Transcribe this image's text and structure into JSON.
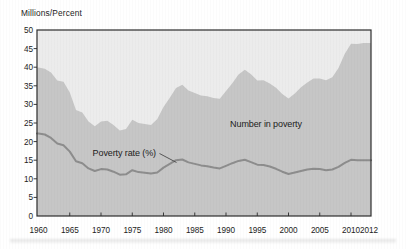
{
  "chart_data": {
    "type": "area",
    "ylabel": "Millions/Percent",
    "xlabel": "",
    "ylim": [
      0,
      50
    ],
    "ytick_step": 5,
    "yticks": [
      0,
      5,
      10,
      15,
      20,
      25,
      30,
      35,
      40,
      45,
      50
    ],
    "xticks": [
      1960,
      1965,
      1970,
      1975,
      1980,
      1985,
      1990,
      1995,
      2000,
      2005,
      2010,
      2012
    ],
    "grid": false,
    "legend": "in-plot annotations",
    "years": [
      1960,
      1961,
      1962,
      1963,
      1964,
      1965,
      1966,
      1967,
      1968,
      1969,
      1970,
      1971,
      1972,
      1973,
      1974,
      1975,
      1976,
      1977,
      1978,
      1979,
      1980,
      1981,
      1982,
      1983,
      1984,
      1985,
      1986,
      1987,
      1988,
      1989,
      1990,
      1991,
      1992,
      1993,
      1994,
      1995,
      1996,
      1997,
      1998,
      1999,
      2000,
      2001,
      2002,
      2003,
      2004,
      2005,
      2006,
      2007,
      2008,
      2009,
      2010,
      2011,
      2012
    ],
    "series": [
      {
        "name": "Number in poverty",
        "type": "area",
        "unit": "millions",
        "values": [
          39.9,
          39.6,
          38.6,
          36.4,
          36.1,
          33.2,
          28.5,
          27.8,
          25.4,
          24.1,
          25.4,
          25.6,
          24.5,
          23.0,
          23.4,
          25.9,
          25.0,
          24.7,
          24.5,
          26.1,
          29.3,
          31.8,
          34.4,
          35.3,
          33.7,
          33.1,
          32.4,
          32.2,
          31.7,
          31.5,
          33.6,
          35.7,
          38.0,
          39.3,
          38.1,
          36.4,
          36.5,
          35.6,
          34.5,
          32.8,
          31.6,
          32.9,
          34.6,
          35.9,
          37.0,
          37.0,
          36.5,
          37.3,
          39.8,
          43.6,
          46.3,
          46.2,
          46.5
        ]
      },
      {
        "name": "Poverty rate (%)",
        "type": "line",
        "unit": "percent",
        "values": [
          22.2,
          21.9,
          21.0,
          19.5,
          19.0,
          17.3,
          14.7,
          14.2,
          12.8,
          12.1,
          12.6,
          12.5,
          11.9,
          11.1,
          11.2,
          12.3,
          11.8,
          11.6,
          11.4,
          11.7,
          13.0,
          14.0,
          15.0,
          15.2,
          14.4,
          14.0,
          13.6,
          13.4,
          13.0,
          12.8,
          13.5,
          14.2,
          14.8,
          15.1,
          14.5,
          13.8,
          13.7,
          13.3,
          12.7,
          11.9,
          11.3,
          11.7,
          12.1,
          12.5,
          12.7,
          12.6,
          12.3,
          12.5,
          13.2,
          14.3,
          15.1,
          15.0,
          15.0
        ]
      }
    ],
    "annotations": [
      {
        "id": "number-in-poverty-label",
        "text": "Number in poverty",
        "x": 266,
        "y": 127,
        "anchor": "middle"
      },
      {
        "id": "poverty-rate-label",
        "text": "Poverty rate (%)",
        "x": 156,
        "y": 156,
        "anchor": "end",
        "leader": {
          "x1": 159.5,
          "y1": 153.5,
          "x2": 176.5,
          "y2": 162.5
        }
      }
    ]
  },
  "colors": {
    "plot_background": "#ececec",
    "area_fill": "#c6c6c6",
    "rate_line": "#8d8d8d",
    "frame": "#2e2e2e",
    "tick": "#3a3a3a",
    "text": "#1c1c1c"
  }
}
